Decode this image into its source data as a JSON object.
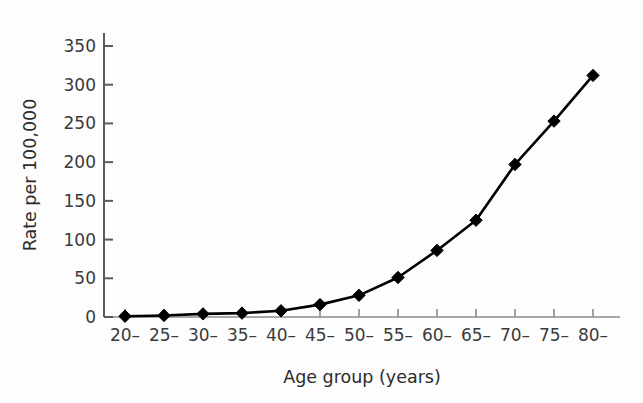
{
  "chart_data": {
    "type": "line",
    "title": "",
    "subtitle": "",
    "xlabel": "Age group (years)",
    "ylabel": "Rate per 100,000",
    "categories": [
      "20–",
      "25–",
      "30–",
      "35–",
      "40–",
      "45–",
      "50–",
      "55–",
      "60–",
      "65–",
      "70–",
      "75–",
      "80–"
    ],
    "values": [
      1,
      2,
      4,
      5,
      8,
      16,
      28,
      51,
      86,
      125,
      197,
      253,
      312
    ],
    "series": [
      {
        "name": "Rate",
        "values": [
          1,
          2,
          4,
          5,
          8,
          16,
          28,
          51,
          86,
          125,
          197,
          253,
          312
        ],
        "marker": "diamond",
        "color": "#000000"
      }
    ],
    "ylim": [
      0,
      350
    ],
    "yticks": [
      0,
      50,
      100,
      150,
      200,
      250,
      300,
      350
    ],
    "ytick_labels": [
      "0",
      "50",
      "100",
      "150",
      "200",
      "250",
      "300",
      "350"
    ],
    "xtick_labels": [
      "20–",
      "25–",
      "30–",
      "35–",
      "40–",
      "45–",
      "50–",
      "55–",
      "60–",
      "65–",
      "70–",
      "75–",
      "80–"
    ],
    "grid": false,
    "legend": null,
    "legend_position": "none",
    "annotations": [],
    "colors": {
      "line": "#111111",
      "marker": "#000000",
      "axis": "#5a5a5a",
      "text": "#2b2b2b",
      "background": "#fdfdfd"
    }
  }
}
